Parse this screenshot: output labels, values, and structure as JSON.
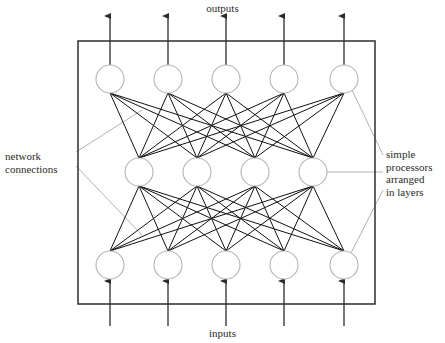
{
  "diagram": {
    "title_top": "outputs",
    "title_bottom": "inputs",
    "annotations": {
      "left": {
        "name": "network-connections",
        "lines": [
          "network",
          "connections"
        ],
        "text": "network\nconnections"
      },
      "right": {
        "name": "simple-processors-arranged-in-layers",
        "lines": [
          "simple",
          "processors",
          "arranged",
          "in layers"
        ],
        "text": "simple\nprocessors\narranged\nin layers"
      }
    },
    "colors": {
      "background": "#ffffff",
      "box_stroke": "#3a3a3a",
      "node_stroke": "#b9b9b9",
      "node_fill": "#ffffff",
      "connection_stroke": "#111111",
      "arrow_stroke": "#2c2c2c",
      "leader_stroke": "#a9a9a9",
      "text": "#2b2b2b"
    },
    "box": {
      "x": 78,
      "y": 41,
      "width": 297,
      "height": 263
    },
    "node_radius": 14,
    "layers": [
      {
        "name": "output-layer",
        "role": "output",
        "y": 79,
        "count": 5,
        "x": [
          110,
          168,
          226,
          284,
          344
        ]
      },
      {
        "name": "hidden-layer",
        "role": "hidden",
        "y": 172,
        "count": 4,
        "x": [
          139,
          197,
          255,
          313
        ]
      },
      {
        "name": "input-layer",
        "role": "input",
        "y": 265,
        "count": 5,
        "x": [
          110,
          168,
          226,
          284,
          344
        ]
      }
    ],
    "connections": [
      {
        "from_layer": 0,
        "to_layer": 1,
        "type": "fully-connected",
        "edge_count": 20
      },
      {
        "from_layer": 1,
        "to_layer": 2,
        "type": "fully-connected",
        "edge_count": 20
      }
    ],
    "output_arrows": {
      "count": 5,
      "x": [
        110,
        168,
        226,
        284,
        344
      ],
      "from_y": 65,
      "to_y": 16,
      "direction": "up"
    },
    "input_arrows": {
      "count": 5,
      "x": [
        110,
        168,
        226,
        284,
        344
      ],
      "from_y": 326,
      "to_y": 281,
      "direction": "up"
    },
    "leaders": {
      "left": [
        {
          "x1": 76,
          "y1": 152,
          "x2": 142,
          "y2": 110
        },
        {
          "x1": 76,
          "y1": 166,
          "x2": 142,
          "y2": 235
        }
      ],
      "right": [
        {
          "x1": 383,
          "y1": 155,
          "x2": 352,
          "y2": 90
        },
        {
          "x1": 383,
          "y1": 172,
          "x2": 327,
          "y2": 172
        },
        {
          "x1": 383,
          "y1": 190,
          "x2": 350,
          "y2": 255
        }
      ]
    }
  }
}
